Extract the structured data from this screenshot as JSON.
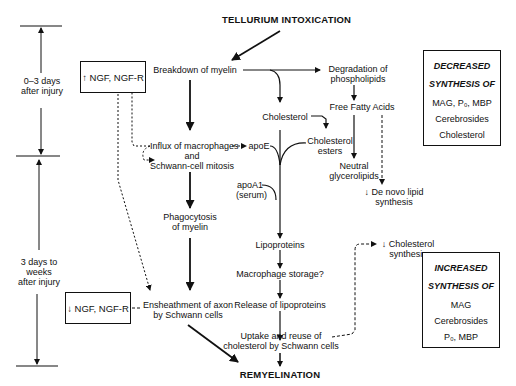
{
  "title": "TELLURIUM INTOXICATION",
  "end": "REMYELINATION",
  "timeline": {
    "phase1": [
      "0–3 days",
      "after injury"
    ],
    "phase2": [
      "3 days to",
      "weeks",
      "after injury"
    ]
  },
  "ngf_boxes": {
    "up": "↑ NGF, NGF-R",
    "down": "↓ NGF, NGF-R"
  },
  "nodes": {
    "breakdown": "Breakdown of myelin",
    "degradation": [
      "Degradation of",
      "phospholipids"
    ],
    "cholesterol": "Cholesterol",
    "ffa": "Free Fatty Acids",
    "influx": [
      "Influx of macrophages",
      "and",
      "Schwann-cell mitosis"
    ],
    "apoE": "apoE",
    "chol_esters": [
      "Cholesterol",
      "esters"
    ],
    "neutral": [
      "Neutral",
      "glycerolipids"
    ],
    "denovo": [
      "↓ De novo lipid",
      "synthesis"
    ],
    "apoA1": [
      "apoA1",
      "(serum)"
    ],
    "lipoproteins": "Lipoproteins",
    "phago": [
      "Phagocytosis",
      "of myelin"
    ],
    "chol_synth": [
      "↓ Cholesterol",
      "synthesis"
    ],
    "macro_storage": "Macrophage storage?",
    "release": "Release of lipoproteins",
    "ensheath": [
      "Ensheathment of axon",
      "by Schwann cells"
    ],
    "uptake": [
      "Uptake and reuse of",
      "cholesterol by Schwann cells"
    ]
  },
  "decreased_box": {
    "heading1": "DECREASED",
    "heading2": "SYNTHESIS OF",
    "items": [
      "MAG, P₀, MBP",
      "Cerebrosides",
      "Cholesterol"
    ]
  },
  "increased_box": {
    "heading1": "INCREASED",
    "heading2": "SYNTHESIS OF",
    "items": [
      "MAG",
      "Cerebrosides",
      "P₀, MBP"
    ]
  }
}
